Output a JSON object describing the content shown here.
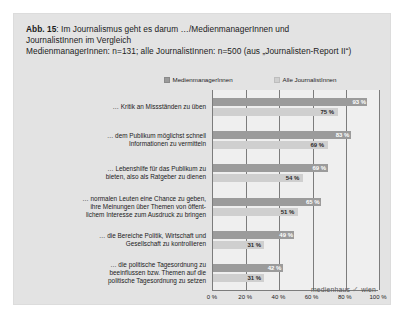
{
  "figure": {
    "label": "Abb. 15",
    "title_line1_rest": ": Im Journalismus geht es darum …/MedienmanagerInnen und",
    "title_line2": "JournalistInnen im Vergleich",
    "title_line3": "MedienmanagerInnen: n=131; alle JournalistInnen: n=500 (aus „Journalisten-Report II“)"
  },
  "logo": {
    "text_left": "medienhaus",
    "check": "✓",
    "text_right": "wien"
  },
  "chart_data": {
    "type": "bar",
    "orientation": "horizontal",
    "title": "Abb. 15: Im Journalismus geht es darum …/MedienmanagerInnen und JournalistInnen im Vergleich",
    "subtitle": "MedienmanagerInnen: n=131; alle JournalistInnen: n=500 (aus „Journalisten-Report II“)",
    "categories": [
      "… Kritik an Missständen zu üben",
      "… dem Publikum möglichst schnell Informationen zu vermitteln",
      "… Lebenshilfe für das Publikum zu bieten, also als Ratgeber zu dienen",
      "… normalen Leuten eine Chance zu geben, ihre Meinungen über Themen von öffentlichem Interesse zum Ausdruck zu bringen",
      "… die Bereiche Politik, Wirtschaft und Gesellschaft zu kontrollieren",
      "… die politische Tagesordnung zu beeinflussen bzw. Themen auf die politische Tagesordnung zu setzen"
    ],
    "category_lines": [
      [
        "… Kritik an Missständen zu üben"
      ],
      [
        "… dem Publikum möglichst schnell",
        "Informationen zu vermitteln"
      ],
      [
        "… Lebenshilfe für das Publikum zu",
        "bieten, also als Ratgeber zu dienen"
      ],
      [
        "… normalen Leuten eine Chance zu geben,",
        "ihre Meinungen über Themen von öffent-",
        "lichem Interesse zum Ausdruck zu bringen"
      ],
      [
        "… die Bereiche Politik, Wirtschaft und",
        "Gesellschaft zu kontrollieren"
      ],
      [
        "… die politische Tagesordnung zu",
        "beeinflussen bzw. Themen auf die",
        "politische Tagesordnung zu setzen"
      ]
    ],
    "series": [
      {
        "name": "MedienmanagerInnen",
        "color": "#9b9b9b",
        "values": [
          93,
          83,
          69,
          65,
          49,
          42
        ],
        "labels": [
          "93 %",
          "83 %",
          "69 %",
          "65 %",
          "49 %",
          "42 %"
        ]
      },
      {
        "name": "Alle JournalistInnen",
        "color": "#cfcfcf",
        "values": [
          75,
          69,
          54,
          51,
          31,
          31
        ],
        "labels": [
          "75 %",
          "69 %",
          "54 %",
          "51 %",
          "31 %",
          "31 %"
        ]
      }
    ],
    "xlabel": "",
    "ylabel": "",
    "xlim": [
      0,
      100
    ],
    "xticks": [
      0,
      20,
      40,
      60,
      80,
      100
    ],
    "xtick_labels": [
      "0 %",
      "20 %",
      "40 %",
      "60 %",
      "80 %",
      "100 %"
    ],
    "grid": true,
    "legend_position": "top-right"
  }
}
